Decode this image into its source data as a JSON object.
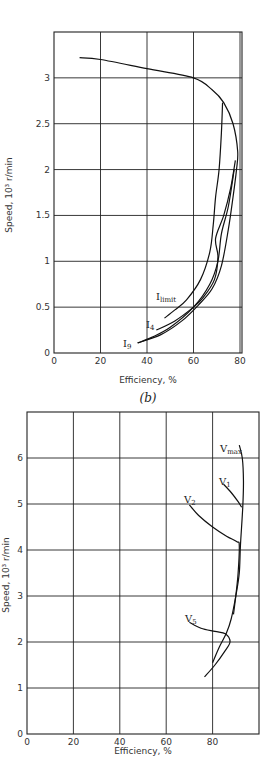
{
  "chart_data": [
    {
      "type": "line",
      "title": "",
      "subtitle": "(b)",
      "xlabel": "Efficiency, %",
      "ylabel": "Speed, 10³ r/min",
      "xlim": [
        0,
        80
      ],
      "ylim": [
        0,
        3.5
      ],
      "xticks": [
        "0",
        "20",
        "40",
        "60",
        "80"
      ],
      "yticks": [
        "0",
        "0.5",
        "1",
        "1.5",
        "2",
        "2.5",
        "3"
      ],
      "grid": true,
      "series": [
        {
          "name": "envelope",
          "points": [
            [
              11,
              3.22
            ],
            [
              20,
              3.2
            ],
            [
              40,
              3.1
            ],
            [
              60,
              3.0
            ],
            [
              68,
              2.87
            ],
            [
              73,
              2.73
            ],
            [
              77,
              2.5
            ],
            [
              79,
              2.2
            ],
            [
              78.5,
              2.0
            ],
            [
              77,
              1.7
            ],
            [
              75,
              1.35
            ],
            [
              72,
              0.95
            ],
            [
              68,
              0.7
            ],
            [
              62,
              0.52
            ],
            [
              55,
              0.35
            ],
            [
              46,
              0.2
            ],
            [
              36,
              0.11
            ]
          ]
        },
        {
          "name": "I_limit",
          "label": "I",
          "label_sub": "limit",
          "points": [
            [
              72.5,
              2.73
            ],
            [
              72,
              2.4
            ],
            [
              71,
              2.0
            ],
            [
              69.5,
              1.7
            ],
            [
              68.5,
              1.4
            ],
            [
              67,
              1.1
            ],
            [
              63,
              0.8
            ],
            [
              57,
              0.58
            ],
            [
              52,
              0.47
            ],
            [
              47.5,
              0.38
            ]
          ]
        },
        {
          "name": "I_4",
          "label": "I",
          "label_sub": "4",
          "points": [
            [
              78,
              2.1
            ],
            [
              76,
              1.8
            ],
            [
              73,
              1.5
            ],
            [
              69.5,
              1.25
            ],
            [
              70.5,
              1.05
            ],
            [
              69,
              0.8
            ],
            [
              64,
              0.6
            ],
            [
              60,
              0.5
            ],
            [
              52,
              0.35
            ],
            [
              44,
              0.25
            ]
          ]
        },
        {
          "name": "I_9",
          "label": "I",
          "label_sub": "9",
          "points": [
            [
              77.5,
              2.0
            ],
            [
              75,
              1.6
            ],
            [
              72,
              1.3
            ],
            [
              70.5,
              1.0
            ],
            [
              67,
              0.75
            ],
            [
              60,
              0.5
            ],
            [
              50,
              0.28
            ],
            [
              42,
              0.17
            ],
            [
              36,
              0.11
            ]
          ]
        }
      ],
      "annotations": [
        "I_limit",
        "I_4",
        "I_9"
      ]
    },
    {
      "type": "line",
      "title": "",
      "xlabel": "Efficiency, %",
      "ylabel": "Speed, 10³ r/min",
      "xlim": [
        0,
        100
      ],
      "ylim": [
        0,
        7
      ],
      "xticks": [
        "0",
        "20",
        "40",
        "60",
        "80"
      ],
      "yticks": [
        "0",
        "1",
        "2",
        "3",
        "4",
        "5",
        "6"
      ],
      "grid": true,
      "series": [
        {
          "name": "V_max",
          "label": "V",
          "label_sub": "max",
          "points": [
            [
              91.5,
              6.28
            ],
            [
              92.8,
              6.0
            ],
            [
              93.3,
              5.5
            ],
            [
              93,
              4.93
            ],
            [
              92,
              4.1
            ],
            [
              91.5,
              3.5
            ],
            [
              90,
              3.0
            ],
            [
              88,
              2.5
            ],
            [
              86,
              2.2
            ],
            [
              83,
              1.9
            ],
            [
              80,
              1.55
            ]
          ]
        },
        {
          "name": "V_1",
          "label": "V",
          "label_sub": "1",
          "points": [
            [
              84.7,
              5.43
            ],
            [
              88,
              5.25
            ],
            [
              91,
              5.05
            ],
            [
              92.5,
              4.93
            ]
          ]
        },
        {
          "name": "V_2",
          "label": "V",
          "label_sub": "2",
          "points": [
            [
              70,
              4.98
            ],
            [
              74,
              4.75
            ],
            [
              80,
              4.5
            ],
            [
              86,
              4.3
            ],
            [
              90.5,
              4.18
            ],
            [
              91.5,
              4.1
            ],
            [
              91,
              3.5
            ],
            [
              90,
              3.0
            ],
            [
              89,
              2.6
            ]
          ]
        },
        {
          "name": "V_5",
          "label": "V",
          "label_sub": "5",
          "points": [
            [
              70,
              2.43
            ],
            [
              75,
              2.3
            ],
            [
              81,
              2.23
            ],
            [
              85.5,
              2.18
            ],
            [
              87.5,
              2.0
            ],
            [
              85,
              1.78
            ],
            [
              81,
              1.5
            ],
            [
              76.5,
              1.24
            ]
          ]
        }
      ],
      "annotations": [
        "V_max",
        "V_1",
        "V_2",
        "V_5"
      ]
    }
  ]
}
